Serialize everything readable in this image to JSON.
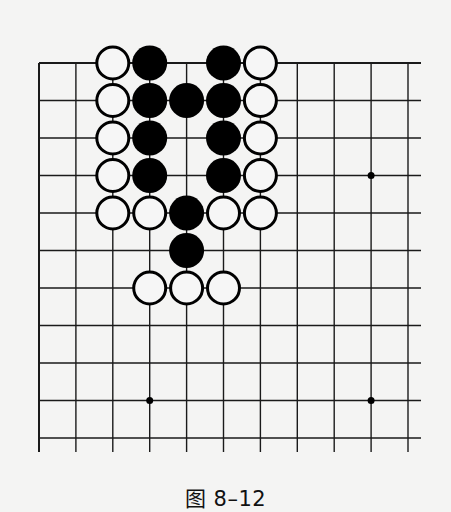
{
  "figure": {
    "caption": "图 8–12"
  },
  "board": {
    "size_cols": 11,
    "size_rows": 11,
    "origin_x": 39,
    "origin_y": 63,
    "spacing_x": 36.9,
    "spacing_y": 37.5,
    "line_extend_right": 13,
    "line_extend_bottom": 14,
    "top_edge": true,
    "left_edge": true,
    "line_color": "#1a1a1a",
    "stone_radius": 17,
    "black_color": "#000000",
    "white_fill": "#f6f6f6",
    "white_stroke": "#000000",
    "star_points": [
      {
        "col": 9,
        "row": 3
      },
      {
        "col": 3,
        "row": 9
      },
      {
        "col": 9,
        "row": 9
      }
    ],
    "stones": [
      {
        "col": 2,
        "row": 0,
        "color": "white"
      },
      {
        "col": 3,
        "row": 0,
        "color": "black"
      },
      {
        "col": 5,
        "row": 0,
        "color": "black"
      },
      {
        "col": 6,
        "row": 0,
        "color": "white"
      },
      {
        "col": 2,
        "row": 1,
        "color": "white"
      },
      {
        "col": 3,
        "row": 1,
        "color": "black"
      },
      {
        "col": 4,
        "row": 1,
        "color": "black"
      },
      {
        "col": 5,
        "row": 1,
        "color": "black"
      },
      {
        "col": 6,
        "row": 1,
        "color": "white"
      },
      {
        "col": 2,
        "row": 2,
        "color": "white"
      },
      {
        "col": 3,
        "row": 2,
        "color": "black"
      },
      {
        "col": 5,
        "row": 2,
        "color": "black"
      },
      {
        "col": 6,
        "row": 2,
        "color": "white"
      },
      {
        "col": 2,
        "row": 3,
        "color": "white"
      },
      {
        "col": 3,
        "row": 3,
        "color": "black"
      },
      {
        "col": 5,
        "row": 3,
        "color": "black"
      },
      {
        "col": 6,
        "row": 3,
        "color": "white"
      },
      {
        "col": 2,
        "row": 4,
        "color": "white"
      },
      {
        "col": 3,
        "row": 4,
        "color": "white"
      },
      {
        "col": 4,
        "row": 4,
        "color": "black"
      },
      {
        "col": 5,
        "row": 4,
        "color": "white"
      },
      {
        "col": 6,
        "row": 4,
        "color": "white"
      },
      {
        "col": 4,
        "row": 5,
        "color": "black"
      },
      {
        "col": 3,
        "row": 6,
        "color": "white"
      },
      {
        "col": 4,
        "row": 6,
        "color": "white"
      },
      {
        "col": 5,
        "row": 6,
        "color": "white"
      }
    ]
  }
}
